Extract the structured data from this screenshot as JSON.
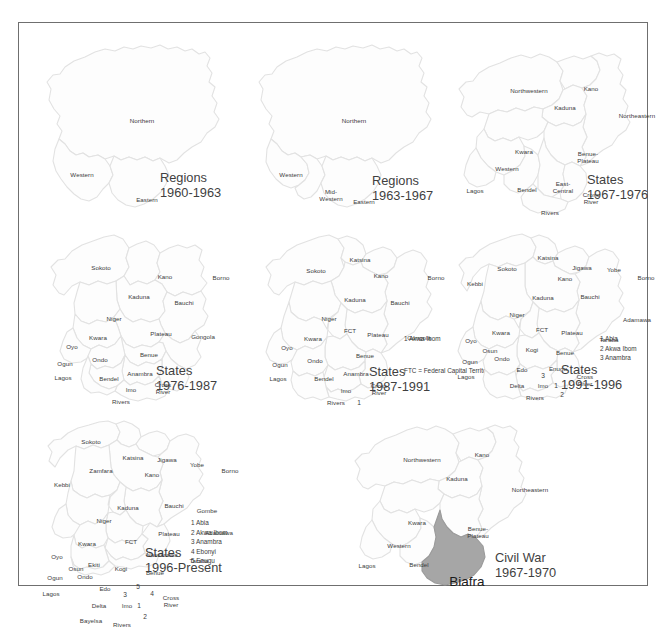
{
  "figure": {
    "frame_color": "#6f6f6f",
    "map_fill": "#fdfdfd",
    "map_stroke": "#e2e2e2",
    "biafra_fill": "#a6a6a6",
    "label_color": "#3b3b3b",
    "title_color": "#3f3f3f"
  },
  "panels": [
    {
      "id": "regions-1960-1963",
      "title_line1": "Regions",
      "title_line2": "1960-1963",
      "labels": [
        {
          "text": "Northern",
          "x": 113,
          "y": 94
        },
        {
          "text": "Western",
          "x": 53,
          "y": 148
        },
        {
          "text": "Eastern",
          "x": 118,
          "y": 173
        }
      ],
      "legend": []
    },
    {
      "id": "regions-1963-1967",
      "title_line1": "Regions",
      "title_line2": "1963-1967",
      "labels": [
        {
          "text": "Northern",
          "x": 113,
          "y": 94
        },
        {
          "text": "Western",
          "x": 50,
          "y": 148
        },
        {
          "text": "Mid-\nWestern",
          "x": 90,
          "y": 168
        },
        {
          "text": "Eastern",
          "x": 123,
          "y": 175
        }
      ],
      "legend": []
    },
    {
      "id": "states-1967-1976",
      "title_line1": "States",
      "title_line2": "1967-1976",
      "labels": [
        {
          "text": "Northwestern",
          "x": 90,
          "y": 64
        },
        {
          "text": "Kano",
          "x": 152,
          "y": 62
        },
        {
          "text": "Kaduna",
          "x": 126,
          "y": 81
        },
        {
          "text": "Northeastern",
          "x": 198,
          "y": 89
        },
        {
          "text": "Kwara",
          "x": 85,
          "y": 125
        },
        {
          "text": "Benue-\nPlateau",
          "x": 149,
          "y": 130
        },
        {
          "text": "Western",
          "x": 68,
          "y": 142
        },
        {
          "text": "Lagos",
          "x": 36,
          "y": 164
        },
        {
          "text": "Bendel",
          "x": 88,
          "y": 163
        },
        {
          "text": "East-\nCentral",
          "x": 124,
          "y": 160
        },
        {
          "text": "Cross\nRiver",
          "x": 152,
          "y": 171
        },
        {
          "text": "Rivers",
          "x": 111,
          "y": 186
        }
      ],
      "legend": []
    },
    {
      "id": "states-1976-1987",
      "title_line1": "States",
      "title_line2": "1976-1987",
      "labels": [
        {
          "text": "Sokoto",
          "x": 72,
          "y": 53
        },
        {
          "text": "Kano",
          "x": 136,
          "y": 62
        },
        {
          "text": "Borno",
          "x": 192,
          "y": 63
        },
        {
          "text": "Kaduna",
          "x": 110,
          "y": 82
        },
        {
          "text": "Bauchi",
          "x": 155,
          "y": 88
        },
        {
          "text": "Niger",
          "x": 85,
          "y": 104
        },
        {
          "text": "Plateau",
          "x": 132,
          "y": 119
        },
        {
          "text": "Gongola",
          "x": 174,
          "y": 122
        },
        {
          "text": "Kwara",
          "x": 69,
          "y": 123
        },
        {
          "text": "Oyo",
          "x": 43,
          "y": 132
        },
        {
          "text": "Benue",
          "x": 120,
          "y": 140
        },
        {
          "text": "Ondo",
          "x": 71,
          "y": 145
        },
        {
          "text": "Ogun",
          "x": 36,
          "y": 149
        },
        {
          "text": "Lagos",
          "x": 34,
          "y": 163
        },
        {
          "text": "Bendel",
          "x": 80,
          "y": 164
        },
        {
          "text": "Anambra",
          "x": 111,
          "y": 159
        },
        {
          "text": "Imo",
          "x": 102,
          "y": 175
        },
        {
          "text": "Cross\nRiver",
          "x": 134,
          "y": 173
        },
        {
          "text": "Rivers",
          "x": 92,
          "y": 187
        }
      ],
      "legend": []
    },
    {
      "id": "states-1987-1991",
      "title_line1": "States",
      "title_line2": "1987-1991",
      "labels": [
        {
          "text": "Katsina",
          "x": 119,
          "y": 45
        },
        {
          "text": "Sokoto",
          "x": 75,
          "y": 56
        },
        {
          "text": "Kano",
          "x": 140,
          "y": 61
        },
        {
          "text": "Borno",
          "x": 195,
          "y": 63
        },
        {
          "text": "Kaduna",
          "x": 114,
          "y": 85
        },
        {
          "text": "Bauchi",
          "x": 159,
          "y": 88
        },
        {
          "text": "Niger",
          "x": 88,
          "y": 104
        },
        {
          "text": "FCT",
          "x": 109,
          "y": 116
        },
        {
          "text": "Plateau",
          "x": 137,
          "y": 120
        },
        {
          "text": "Gongola",
          "x": 178,
          "y": 123
        },
        {
          "text": "Kwara",
          "x": 72,
          "y": 124
        },
        {
          "text": "Oyo",
          "x": 46,
          "y": 133
        },
        {
          "text": "Benue",
          "x": 124,
          "y": 141
        },
        {
          "text": "Ondo",
          "x": 74,
          "y": 146
        },
        {
          "text": "Ogun",
          "x": 39,
          "y": 150
        },
        {
          "text": "Lagos",
          "x": 37,
          "y": 164
        },
        {
          "text": "Bendel",
          "x": 83,
          "y": 164
        },
        {
          "text": "Anambra",
          "x": 115,
          "y": 159
        },
        {
          "text": "Imo",
          "x": 105,
          "y": 176
        },
        {
          "text": "Cross\nRiver",
          "x": 138,
          "y": 174
        },
        {
          "text": "Rivers",
          "x": 95,
          "y": 188
        },
        {
          "text": "1",
          "x": 118,
          "y": 188,
          "num": true
        }
      ],
      "legend": [
        "1 Akwa Ibom",
        "FTC = Federal Capital Territory"
      ]
    },
    {
      "id": "states-1991-1996",
      "title_line1": "States",
      "title_line2": "1991-1996",
      "labels": [
        {
          "text": "Katsina",
          "x": 109,
          "y": 43
        },
        {
          "text": "Sokoto",
          "x": 68,
          "y": 54
        },
        {
          "text": "Jigawa",
          "x": 143,
          "y": 53
        },
        {
          "text": "Yobe",
          "x": 175,
          "y": 55
        },
        {
          "text": "Kano",
          "x": 126,
          "y": 64
        },
        {
          "text": "Borno",
          "x": 207,
          "y": 63
        },
        {
          "text": "Kebbi",
          "x": 36,
          "y": 69
        },
        {
          "text": "Kaduna",
          "x": 104,
          "y": 83
        },
        {
          "text": "Bauchi",
          "x": 151,
          "y": 82
        },
        {
          "text": "Niger",
          "x": 78,
          "y": 100
        },
        {
          "text": "Adamawa",
          "x": 198,
          "y": 105
        },
        {
          "text": "Kwara",
          "x": 62,
          "y": 118
        },
        {
          "text": "FCT",
          "x": 103,
          "y": 115
        },
        {
          "text": "Plateau",
          "x": 133,
          "y": 118
        },
        {
          "text": "Taraba",
          "x": 170,
          "y": 125
        },
        {
          "text": "Oyo",
          "x": 32,
          "y": 126
        },
        {
          "text": "Osun",
          "x": 51,
          "y": 136
        },
        {
          "text": "Kogi",
          "x": 93,
          "y": 135
        },
        {
          "text": "Benue",
          "x": 126,
          "y": 138
        },
        {
          "text": "Ogun",
          "x": 31,
          "y": 147
        },
        {
          "text": "Ondo",
          "x": 63,
          "y": 144
        },
        {
          "text": "Edo",
          "x": 83,
          "y": 155
        },
        {
          "text": "Enugu",
          "x": 119,
          "y": 154
        },
        {
          "text": "3",
          "x": 104,
          "y": 161,
          "num": true
        },
        {
          "text": "Lagos",
          "x": 27,
          "y": 162
        },
        {
          "text": "Cross\nRiver",
          "x": 146,
          "y": 165
        },
        {
          "text": "Delta",
          "x": 78,
          "y": 171
        },
        {
          "text": "Imo",
          "x": 104,
          "y": 171
        },
        {
          "text": "1",
          "x": 117,
          "y": 171,
          "num": true
        },
        {
          "text": "Rivers",
          "x": 96,
          "y": 183
        },
        {
          "text": "2",
          "x": 123,
          "y": 180,
          "num": true
        }
      ],
      "legend": [
        "1 Abia",
        "2 Akwa Ibom",
        "3 Anambra"
      ]
    },
    {
      "id": "states-1996-present",
      "title_line1": "States",
      "title_line2": "1996-Present",
      "labels": [
        {
          "text": "Sokoto",
          "x": 62,
          "y": 37
        },
        {
          "text": "Katsina",
          "x": 104,
          "y": 53
        },
        {
          "text": "Jigawa",
          "x": 138,
          "y": 55
        },
        {
          "text": "Zamfara",
          "x": 72,
          "y": 66
        },
        {
          "text": "Kano",
          "x": 123,
          "y": 70
        },
        {
          "text": "Yobe",
          "x": 168,
          "y": 60
        },
        {
          "text": "Borno",
          "x": 201,
          "y": 66
        },
        {
          "text": "Kebbi",
          "x": 33,
          "y": 80
        },
        {
          "text": "Kaduna",
          "x": 99,
          "y": 103
        },
        {
          "text": "Bauchi",
          "x": 145,
          "y": 101
        },
        {
          "text": "Gombe",
          "x": 178,
          "y": 106
        },
        {
          "text": "Niger",
          "x": 75,
          "y": 116
        },
        {
          "text": "Plateau",
          "x": 140,
          "y": 129
        },
        {
          "text": "Adamawa",
          "x": 190,
          "y": 128
        },
        {
          "text": "Kwara",
          "x": 58,
          "y": 139
        },
        {
          "text": "FCT",
          "x": 102,
          "y": 137
        },
        {
          "text": "Nassarawa",
          "x": 133,
          "y": 150
        },
        {
          "text": "Taraba",
          "x": 170,
          "y": 156
        },
        {
          "text": "Oyo",
          "x": 28,
          "y": 152
        },
        {
          "text": "Osun",
          "x": 47,
          "y": 164
        },
        {
          "text": "Ekiti",
          "x": 65,
          "y": 160
        },
        {
          "text": "Kogi",
          "x": 92,
          "y": 164
        },
        {
          "text": "Benue",
          "x": 126,
          "y": 168
        },
        {
          "text": "Ogun",
          "x": 26,
          "y": 173
        },
        {
          "text": "Ondo",
          "x": 56,
          "y": 172
        },
        {
          "text": "Edo",
          "x": 76,
          "y": 184
        },
        {
          "text": "5",
          "x": 109,
          "y": 182,
          "num": true
        },
        {
          "text": "3",
          "x": 96,
          "y": 190,
          "num": true
        },
        {
          "text": "4",
          "x": 123,
          "y": 189,
          "num": true
        },
        {
          "text": "Lagos",
          "x": 22,
          "y": 189
        },
        {
          "text": "Cross\nRiver",
          "x": 142,
          "y": 196
        },
        {
          "text": "Delta",
          "x": 70,
          "y": 201
        },
        {
          "text": "Imo",
          "x": 98,
          "y": 201
        },
        {
          "text": "1",
          "x": 110,
          "y": 201,
          "num": true
        },
        {
          "text": "Bayelsa",
          "x": 62,
          "y": 216
        },
        {
          "text": "Rivers",
          "x": 93,
          "y": 220
        },
        {
          "text": "2",
          "x": 116,
          "y": 212,
          "num": true
        }
      ],
      "legend": [
        "1 Abia",
        "2 Akwa Ibom",
        "3 Anambra",
        "4 Ebonyi",
        "5 Enugu"
      ]
    },
    {
      "id": "civil-war-1967-1970",
      "title_line1": "Civil War",
      "title_line2": "1967-1970",
      "labels": [
        {
          "text": "Northwestern",
          "x": 85,
          "y": 55
        },
        {
          "text": "Kano",
          "x": 145,
          "y": 50
        },
        {
          "text": "Kaduna",
          "x": 120,
          "y": 74
        },
        {
          "text": "Northeastern",
          "x": 193,
          "y": 85
        },
        {
          "text": "Kwara",
          "x": 80,
          "y": 118
        },
        {
          "text": "Benue-\nPlateau",
          "x": 141,
          "y": 127
        },
        {
          "text": "Western",
          "x": 62,
          "y": 141
        },
        {
          "text": "Lagos",
          "x": 30,
          "y": 161
        },
        {
          "text": "Bendel",
          "x": 82,
          "y": 160
        },
        {
          "text": "Biafra",
          "x": 130,
          "y": 177,
          "biafra": true
        }
      ],
      "legend": []
    }
  ]
}
